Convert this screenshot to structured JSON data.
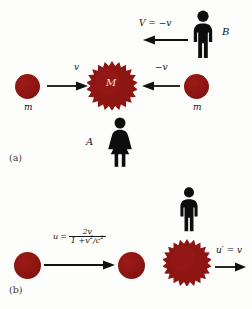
{
  "figure": {
    "type": "physics-diagram",
    "topic": "Relativistic velocity addition — collision viewed from two reference frames",
    "background_color": "#fdfdfc",
    "body_color": "#8d1512",
    "ink_color": "#141414"
  },
  "panel_a": {
    "label": "(a)",
    "observer_b": {
      "name": "B",
      "figure_type": "male-standing",
      "velocity_label": "V = −v",
      "arrow_direction": "left"
    },
    "observer_a": {
      "name": "A",
      "figure_type": "female-standing"
    },
    "left_particle": {
      "mass_label": "m",
      "velocity_label": "v",
      "arrow_direction": "right",
      "shape": "circle"
    },
    "right_particle": {
      "mass_label": "m",
      "velocity_label": "−v",
      "arrow_direction": "left",
      "shape": "circle"
    },
    "center_body": {
      "mass_label": "M",
      "shape": "starburst",
      "spikes": 20
    }
  },
  "panel_b": {
    "label": "(b)",
    "left_scene": {
      "formula": {
        "lhs": "u",
        "equals": "=",
        "numerator": "2v",
        "denominator_lead": "1 +",
        "denominator_frac_num": "v",
        "denominator_frac_num_exp": "2",
        "denominator_frac_den": "c",
        "denominator_frac_den_exp": "2",
        "denominator_text": "1 + v²/c²",
        "plain": "u = 2v / (1 + v²/c²)"
      },
      "arrow_direction": "right",
      "source_particle_shape": "circle",
      "target_particle_shape": "circle"
    },
    "right_scene": {
      "observer": {
        "figure_type": "male-standing"
      },
      "body_shape": "starburst",
      "velocity_label": "u′ = v",
      "arrow_direction": "right"
    }
  }
}
